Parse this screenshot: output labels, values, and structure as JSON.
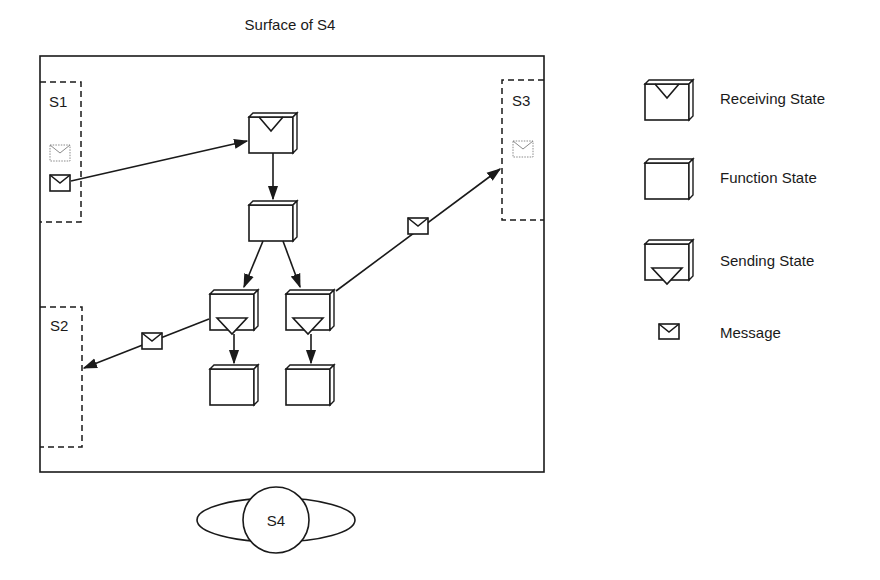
{
  "diagram": {
    "title": "Surface of S4",
    "surfaces": {
      "s1": "S1",
      "s2": "S2",
      "s3": "S3",
      "s4": "S4"
    },
    "legend": [
      {
        "label": "Receiving State",
        "icon": "receiving-state-icon"
      },
      {
        "label": "Function State",
        "icon": "function-state-icon"
      },
      {
        "label": "Sending State",
        "icon": "sending-state-icon"
      },
      {
        "label": "Message",
        "icon": "message-icon"
      }
    ],
    "colors": {
      "stroke": "#1a1a1a",
      "ghost": "#8a8a8a",
      "background": "#ffffff"
    }
  }
}
